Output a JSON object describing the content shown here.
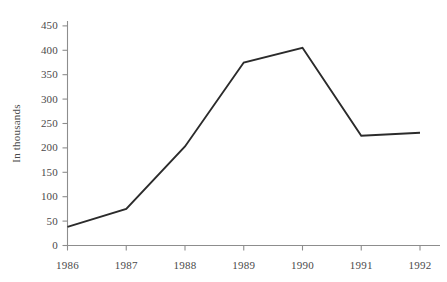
{
  "chart_data": {
    "type": "line",
    "title": "",
    "subtitle": "",
    "xlabel": "",
    "ylabel": "In thousands",
    "categories": [
      "1986",
      "1987",
      "1988",
      "1989",
      "1990",
      "1991",
      "1992"
    ],
    "x": [
      1986,
      1987,
      1988,
      1989,
      1990,
      1991,
      1992
    ],
    "values": [
      38,
      75,
      203,
      375,
      405,
      225,
      231
    ],
    "series": [
      {
        "name": "",
        "values": [
          38,
          75,
          203,
          375,
          405,
          225,
          231
        ]
      }
    ],
    "ylim": [
      0,
      460
    ],
    "xlim": [
      1986,
      1992
    ],
    "ytick_labels": [
      "0",
      "50",
      "100",
      "150",
      "200",
      "250",
      "300",
      "350",
      "400",
      "450"
    ],
    "ytick_values": [
      0,
      50,
      100,
      150,
      200,
      250,
      300,
      350,
      400,
      450
    ],
    "xtick_labels": [
      "1986",
      "1987",
      "1988",
      "1989",
      "1990",
      "1991",
      "1992"
    ],
    "grid": false,
    "legend": false,
    "legend_position": "none",
    "markers": false,
    "line_color": "#2b2b2b",
    "axis_color": "#8a8a8a",
    "text_color": "#4a4a4a",
    "background_color": "#ffffff"
  },
  "axes": {
    "y_label_text": "In thousands"
  }
}
